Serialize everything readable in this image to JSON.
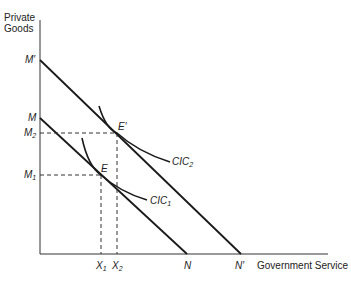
{
  "axes": {
    "y_label_line1": "Private",
    "y_label_line2": "Goods",
    "x_label": "Government Service"
  },
  "y_ticks": {
    "m_prime": "M′",
    "m": "M",
    "m2_base": "M",
    "m2_sub": "2",
    "m1_base": "M",
    "m1_sub": "1"
  },
  "x_ticks": {
    "x1_base": "X",
    "x1_sub": "1",
    "x2_base": "X",
    "x2_sub": "2",
    "n": "N",
    "n_prime": "N′"
  },
  "points": {
    "e": "E",
    "e_prime": "E′"
  },
  "curves": {
    "cic2_base": "CIC",
    "cic2_sub": "2",
    "cic1_base": "CIC",
    "cic1_sub": "1"
  },
  "colors": {
    "line": "#1a1a1a",
    "axis": "#333333",
    "dash": "#333333"
  }
}
